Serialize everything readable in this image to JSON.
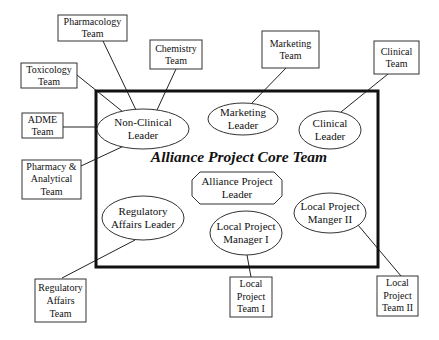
{
  "diagram": {
    "title": "Alliance Project Core Team",
    "center_node": {
      "label": "Alliance Project\nLeader",
      "shape": "octagon"
    },
    "leaders": [
      {
        "id": "non-clinical-leader",
        "label": "Non-Clinical\nLeader"
      },
      {
        "id": "marketing-leader",
        "label": "Marketing\nLeader"
      },
      {
        "id": "clinical-leader",
        "label": "Clinical\nLeader"
      },
      {
        "id": "regulatory-affairs-leader",
        "label": "Regulatory\nAffairs Leader"
      },
      {
        "id": "local-project-manager-1",
        "label": "Local Project\nManager I"
      },
      {
        "id": "local-project-manager-2",
        "label": "Local Project\nManger II"
      }
    ],
    "teams": [
      {
        "id": "pharmacology-team",
        "label": "Pharmacology\nTeam",
        "connects_to": "non-clinical-leader"
      },
      {
        "id": "chemistry-team",
        "label": "Chemistry\nTeam",
        "connects_to": "non-clinical-leader"
      },
      {
        "id": "toxicology-team",
        "label": "Toxicology\nTeam",
        "connects_to": "non-clinical-leader"
      },
      {
        "id": "adme-team",
        "label": "ADME\nTeam",
        "connects_to": "non-clinical-leader"
      },
      {
        "id": "pharmacy-analytical-team",
        "label": "Pharmacy &\nAnalytical\nTeam",
        "connects_to": "non-clinical-leader"
      },
      {
        "id": "marketing-team",
        "label": "Marketing\nTeam",
        "connects_to": "marketing-leader"
      },
      {
        "id": "clinical-team",
        "label": "Clinical\nTeam",
        "connects_to": "clinical-leader"
      },
      {
        "id": "regulatory-affairs-team",
        "label": "Regulatory\nAffairs\nTeam",
        "connects_to": "regulatory-affairs-leader"
      },
      {
        "id": "local-project-team-1",
        "label": "Local\nProject\nTeam I",
        "connects_to": "local-project-manager-1"
      },
      {
        "id": "local-project-team-2",
        "label": "Local\nProject\nTeam II",
        "connects_to": "local-project-manager-2"
      }
    ]
  }
}
